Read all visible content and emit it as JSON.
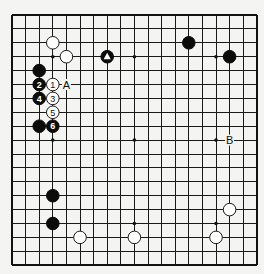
{
  "board": {
    "size": 19,
    "origin_px": {
      "x": 12,
      "y": 15
    },
    "spacing_px": {
      "x": 13.6,
      "y": 13.9
    },
    "colors": {
      "background": "#f4f4f2",
      "lines": "#1a1a1a",
      "black": "#0c0c0c",
      "white": "#ffffff"
    },
    "star_points": [
      {
        "col": 3,
        "row": 3
      },
      {
        "col": 9,
        "row": 3
      },
      {
        "col": 15,
        "row": 3
      },
      {
        "col": 3,
        "row": 9
      },
      {
        "col": 9,
        "row": 9
      },
      {
        "col": 15,
        "row": 9
      },
      {
        "col": 3,
        "row": 15
      },
      {
        "col": 9,
        "row": 15
      },
      {
        "col": 15,
        "row": 15
      }
    ]
  },
  "stones": [
    {
      "color": "white",
      "col": 3,
      "row": 2,
      "label": ""
    },
    {
      "color": "white",
      "col": 4,
      "row": 3,
      "label": ""
    },
    {
      "color": "black",
      "col": 7,
      "row": 3,
      "label": "",
      "mark": "triangle"
    },
    {
      "color": "black",
      "col": 13,
      "row": 2,
      "label": ""
    },
    {
      "color": "black",
      "col": 16,
      "row": 3,
      "label": ""
    },
    {
      "color": "black",
      "col": 2,
      "row": 4,
      "label": ""
    },
    {
      "color": "white",
      "col": 3,
      "row": 5,
      "label": "1"
    },
    {
      "color": "black",
      "col": 2,
      "row": 5,
      "label": "2"
    },
    {
      "color": "white",
      "col": 3,
      "row": 6,
      "label": "3"
    },
    {
      "color": "black",
      "col": 2,
      "row": 6,
      "label": "4"
    },
    {
      "color": "white",
      "col": 3,
      "row": 7,
      "label": "5"
    },
    {
      "color": "black",
      "col": 3,
      "row": 8,
      "label": "6"
    },
    {
      "color": "black",
      "col": 2,
      "row": 8,
      "label": ""
    },
    {
      "color": "black",
      "col": 3,
      "row": 13,
      "label": ""
    },
    {
      "color": "black",
      "col": 3,
      "row": 15,
      "label": ""
    },
    {
      "color": "white",
      "col": 5,
      "row": 16,
      "label": ""
    },
    {
      "color": "white",
      "col": 9,
      "row": 16,
      "label": ""
    },
    {
      "color": "white",
      "col": 16,
      "row": 14,
      "label": ""
    },
    {
      "color": "white",
      "col": 15,
      "row": 16,
      "label": ""
    }
  ],
  "letters": [
    {
      "text": "A",
      "col": 4,
      "row": 5
    },
    {
      "text": "B",
      "col": 16,
      "row": 9
    }
  ]
}
